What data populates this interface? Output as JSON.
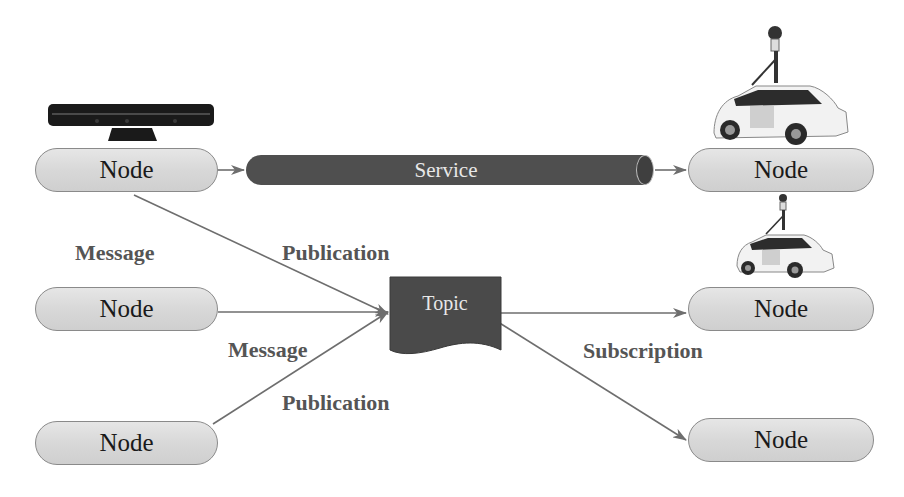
{
  "diagram": {
    "type": "ROS communication diagram",
    "colors": {
      "node_fill": "#d9d9d9",
      "node_border": "#8a8a8a",
      "service_fill": "#4f4f4f",
      "topic_fill": "#4a4a4a",
      "arrow": "#6e6e6e",
      "label_text": "#555555"
    },
    "left_nodes": [
      {
        "label": "Node",
        "device": "kinect-sensor"
      },
      {
        "label": "Node"
      },
      {
        "label": "Node"
      }
    ],
    "right_nodes": [
      {
        "label": "Node",
        "device": "street-view-car"
      },
      {
        "label": "Node",
        "device": "street-view-car"
      },
      {
        "label": "Node"
      }
    ],
    "service": {
      "label": "Service"
    },
    "topic": {
      "label": "Topic"
    },
    "edge_labels": {
      "message_top": "Message",
      "publication_top": "Publication",
      "message_middle": "Message",
      "publication_bottom": "Publication",
      "subscription": "Subscription"
    }
  }
}
